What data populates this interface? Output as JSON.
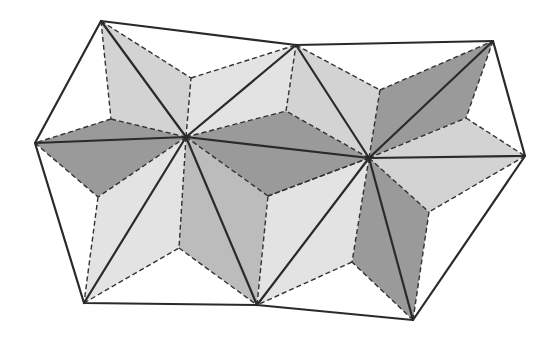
{
  "diagram": {
    "title": "Periodic tiling of two star-kite rosettes",
    "colors": {
      "background": "#ffffff",
      "dark": "#9a9a9a",
      "medium": "#bcbcbc",
      "light": "#d3d3d3",
      "very_light": "#e3e3e3",
      "line": "#2a2a2a"
    },
    "points": {
      "A": [
        101,
        21
      ],
      "B": [
        296,
        45
      ],
      "C": [
        493,
        41
      ],
      "D": [
        525,
        156
      ],
      "E": [
        413,
        320
      ],
      "F": [
        257,
        305
      ],
      "G": [
        84,
        303
      ],
      "H": [
        35,
        143
      ],
      "P1": [
        186,
        137
      ],
      "P2": [
        369,
        158
      ],
      "Q1": [
        191,
        78
      ],
      "Q2": [
        111,
        119
      ],
      "Q3": [
        98,
        197
      ],
      "Q4": [
        179,
        248
      ],
      "Q5": [
        268,
        196
      ],
      "Q6": [
        286,
        111
      ],
      "R1": [
        380,
        90
      ],
      "R2": [
        466,
        118
      ],
      "R3": [
        429,
        212
      ],
      "R4": [
        352,
        262
      ]
    },
    "kites": [
      {
        "name": "kite-p1-a",
        "pts": [
          "P1",
          "Q1",
          "A",
          "Q2"
        ],
        "shade": "light"
      },
      {
        "name": "kite-p1-h",
        "pts": [
          "P1",
          "Q2",
          "H",
          "Q3"
        ],
        "shade": "dark"
      },
      {
        "name": "kite-p1-g",
        "pts": [
          "P1",
          "Q3",
          "G",
          "Q4"
        ],
        "shade": "very_light"
      },
      {
        "name": "kite-p1-f",
        "pts": [
          "P1",
          "Q4",
          "F",
          "Q5"
        ],
        "shade": "medium"
      },
      {
        "name": "kite-p1-p2",
        "pts": [
          "P1",
          "Q5",
          "P2",
          "Q6"
        ],
        "shade": "dark"
      },
      {
        "name": "kite-p1-b",
        "pts": [
          "P1",
          "Q6",
          "B",
          "Q1"
        ],
        "shade": "very_light"
      },
      {
        "name": "kite-p2-b",
        "pts": [
          "P2",
          "Q6",
          "B",
          "R1"
        ],
        "shade": "light"
      },
      {
        "name": "kite-p2-c",
        "pts": [
          "P2",
          "R1",
          "C",
          "R2"
        ],
        "shade": "dark"
      },
      {
        "name": "kite-p2-d",
        "pts": [
          "P2",
          "R2",
          "D",
          "R3"
        ],
        "shade": "light"
      },
      {
        "name": "kite-p2-e",
        "pts": [
          "P2",
          "R3",
          "E",
          "R4"
        ],
        "shade": "dark"
      },
      {
        "name": "kite-p2-f",
        "pts": [
          "P2",
          "R4",
          "F",
          "Q5"
        ],
        "shade": "very_light"
      }
    ],
    "outline": [
      "A",
      "B",
      "C",
      "D",
      "E",
      "F",
      "G",
      "H"
    ],
    "solid_lines": [
      [
        "P1",
        "A"
      ],
      [
        "P1",
        "B"
      ],
      [
        "P1",
        "H"
      ],
      [
        "P1",
        "G"
      ],
      [
        "P1",
        "F"
      ],
      [
        "P1",
        "P2"
      ],
      [
        "P2",
        "B"
      ],
      [
        "P2",
        "C"
      ],
      [
        "P2",
        "D"
      ],
      [
        "P2",
        "E"
      ],
      [
        "P2",
        "F"
      ]
    ],
    "dashed_lines": [
      [
        "A",
        "Q1"
      ],
      [
        "Q1",
        "B"
      ],
      [
        "A",
        "Q2"
      ],
      [
        "Q2",
        "H"
      ],
      [
        "H",
        "Q3"
      ],
      [
        "Q3",
        "G"
      ],
      [
        "G",
        "Q4"
      ],
      [
        "Q4",
        "F"
      ],
      [
        "F",
        "Q5"
      ],
      [
        "Q5",
        "P2"
      ],
      [
        "P2",
        "Q6"
      ],
      [
        "Q6",
        "B"
      ],
      [
        "P1",
        "Q1"
      ],
      [
        "P1",
        "Q2"
      ],
      [
        "P1",
        "Q3"
      ],
      [
        "P1",
        "Q4"
      ],
      [
        "P1",
        "Q5"
      ],
      [
        "P1",
        "Q6"
      ],
      [
        "B",
        "R1"
      ],
      [
        "R1",
        "C"
      ],
      [
        "C",
        "R2"
      ],
      [
        "R2",
        "D"
      ],
      [
        "D",
        "R3"
      ],
      [
        "R3",
        "E"
      ],
      [
        "E",
        "R4"
      ],
      [
        "R4",
        "F"
      ],
      [
        "P2",
        "R1"
      ],
      [
        "P2",
        "R2"
      ],
      [
        "P2",
        "R3"
      ],
      [
        "P2",
        "R4"
      ],
      [
        "P2",
        "Q5"
      ]
    ]
  }
}
